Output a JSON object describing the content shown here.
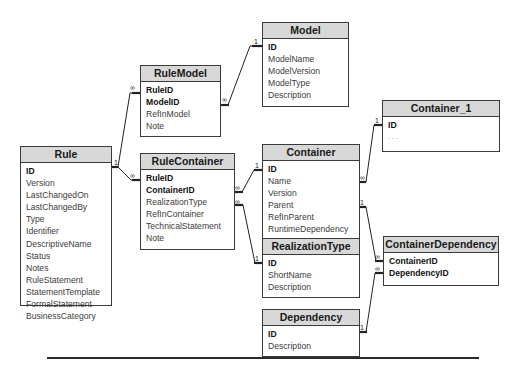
{
  "diagram": {
    "type": "entity-relationship",
    "tables": [
      {
        "id": "rule",
        "name": "Rule",
        "fields": [
          {
            "name": "ID",
            "key": true
          },
          {
            "name": "Version",
            "key": false
          },
          {
            "name": "LastChangedOn",
            "key": false
          },
          {
            "name": "LastChangedBy",
            "key": false
          },
          {
            "name": "Type",
            "key": false
          },
          {
            "name": "Identifier",
            "key": false
          },
          {
            "name": "DescriptiveName",
            "key": false
          },
          {
            "name": "Status",
            "key": false
          },
          {
            "name": "Notes",
            "key": false
          },
          {
            "name": "RuleStatement",
            "key": false
          },
          {
            "name": "StatementTemplate",
            "key": false
          },
          {
            "name": "FormalStatement",
            "key": false
          },
          {
            "name": "BusinessCategory",
            "key": false
          }
        ]
      },
      {
        "id": "rulemodel",
        "name": "RuleModel",
        "fields": [
          {
            "name": "RuleID",
            "key": true
          },
          {
            "name": "ModelID",
            "key": true
          },
          {
            "name": "RefInModel",
            "key": false
          },
          {
            "name": "Note",
            "key": false
          }
        ]
      },
      {
        "id": "model",
        "name": "Model",
        "fields": [
          {
            "name": "ID",
            "key": true
          },
          {
            "name": "ModelName",
            "key": false
          },
          {
            "name": "ModelVersion",
            "key": false
          },
          {
            "name": "ModelType",
            "key": false
          },
          {
            "name": "Description",
            "key": false
          }
        ]
      },
      {
        "id": "rulecontainer",
        "name": "RuleContainer",
        "fields": [
          {
            "name": "RuleID",
            "key": true
          },
          {
            "name": "ContainerID",
            "key": true
          },
          {
            "name": "RealizationType",
            "key": false
          },
          {
            "name": "RefInContainer",
            "key": false
          },
          {
            "name": "TechnicalStatement",
            "key": false
          },
          {
            "name": "Note",
            "key": false
          }
        ]
      },
      {
        "id": "container",
        "name": "Container",
        "fields": [
          {
            "name": "ID",
            "key": true
          },
          {
            "name": "Name",
            "key": false
          },
          {
            "name": "Version",
            "key": false
          },
          {
            "name": "Parent",
            "key": false
          },
          {
            "name": "RefInParent",
            "key": false
          },
          {
            "name": "RuntimeDependency",
            "key": false
          },
          {
            "name": "Description",
            "key": false
          }
        ]
      },
      {
        "id": "container_1",
        "name": "Container_1",
        "fields": [
          {
            "name": "ID",
            "key": true
          },
          {
            "name": ". . .",
            "key": false
          }
        ]
      },
      {
        "id": "realizationtype",
        "name": "RealizationType",
        "fields": [
          {
            "name": "ID",
            "key": true
          },
          {
            "name": "ShortName",
            "key": false
          },
          {
            "name": "Description",
            "key": false
          }
        ]
      },
      {
        "id": "dependency",
        "name": "Dependency",
        "fields": [
          {
            "name": "ID",
            "key": true
          },
          {
            "name": "Description",
            "key": false
          }
        ]
      },
      {
        "id": "containerdependency",
        "name": "ContainerDependency",
        "fields": [
          {
            "name": "ContainerID",
            "key": true
          },
          {
            "name": "DependencyID",
            "key": true
          }
        ]
      }
    ],
    "relationships": [
      {
        "from": "Rule.ID",
        "from_card": "1",
        "to": "RuleModel.RuleID",
        "to_card": "∞"
      },
      {
        "from": "Model.ID",
        "from_card": "1",
        "to": "RuleModel.ModelID",
        "to_card": "∞"
      },
      {
        "from": "Rule.ID",
        "from_card": "1",
        "to": "RuleContainer.RuleID",
        "to_card": "∞"
      },
      {
        "from": "Container.ID",
        "from_card": "1",
        "to": "RuleContainer.ContainerID",
        "to_card": "∞"
      },
      {
        "from": "RealizationType.ID",
        "from_card": "1",
        "to": "RuleContainer.RealizationType",
        "to_card": "∞"
      },
      {
        "from": "Container_1.ID",
        "from_card": "1",
        "to": "Container.Parent",
        "to_card": "∞"
      },
      {
        "from": "Container.RuntimeDependency",
        "from_card": "1",
        "to": "ContainerDependency.ContainerID",
        "to_card": "∞"
      },
      {
        "from": "Dependency.ID",
        "from_card": "1",
        "to": "ContainerDependency.DependencyID",
        "to_card": "∞"
      }
    ],
    "cardinality_labels": {
      "one": "1",
      "many": "∞"
    }
  }
}
